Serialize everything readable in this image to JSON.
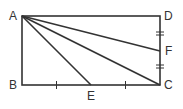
{
  "diagram": {
    "type": "geometry",
    "shape": "rectangle ABCD with segments AE, AC, AF",
    "points": {
      "A": {
        "label": "A",
        "x": 22,
        "y": 16
      },
      "B": {
        "label": "B",
        "x": 22,
        "y": 85
      },
      "C": {
        "label": "C",
        "x": 160,
        "y": 85
      },
      "D": {
        "label": "D",
        "x": 160,
        "y": 16
      },
      "E": {
        "label": "E",
        "x": 91,
        "y": 85
      },
      "F": {
        "label": "F",
        "x": 160,
        "y": 51
      }
    },
    "segments": [
      "AB",
      "BC",
      "CD",
      "DA",
      "AE",
      "AC",
      "AF"
    ],
    "tick_marks": {
      "BC": "single ticks at midpoints of BE and EC (BE = EC)",
      "DC": "double ticks at midpoints of DF and FC (DF = FC)"
    },
    "stroke_color": "#333333"
  }
}
